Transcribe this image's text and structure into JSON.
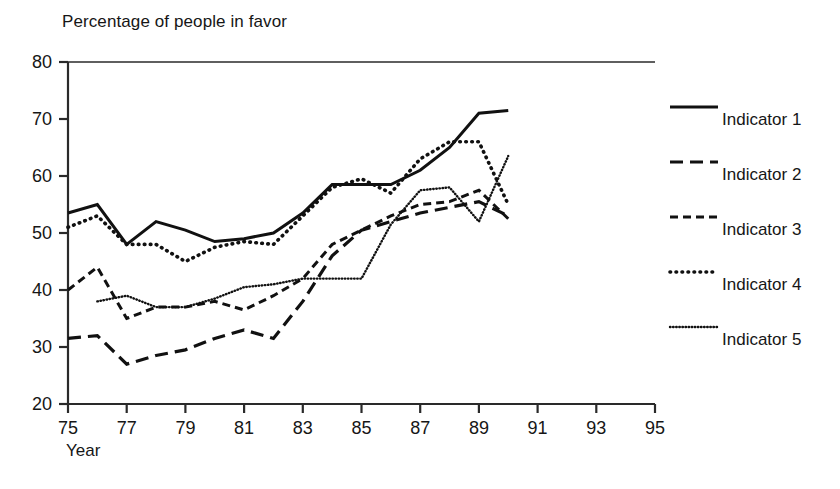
{
  "chart_data": {
    "type": "line",
    "title": "Percentage of people in favor",
    "xlabel": "Year",
    "ylabel": "",
    "xlim": [
      75,
      95
    ],
    "ylim": [
      20,
      80
    ],
    "xticks": [
      75,
      77,
      79,
      81,
      83,
      85,
      87,
      89,
      91,
      93,
      95
    ],
    "yticks": [
      20,
      30,
      40,
      50,
      60,
      70,
      80
    ],
    "xtick_labels": [
      "75",
      "77",
      "79",
      "81",
      "83",
      "85",
      "87",
      "89",
      "91",
      "93",
      "95"
    ],
    "ytick_labels": [
      "20",
      "30",
      "40",
      "50",
      "60",
      "70",
      "80"
    ],
    "grid": false,
    "legend_position": "right",
    "x": [
      75,
      76,
      77,
      78,
      79,
      80,
      81,
      82,
      83,
      84,
      85,
      86,
      87,
      88,
      89,
      90
    ],
    "series": [
      {
        "name": "Indicator 1",
        "style": "solid",
        "color": "#111111",
        "x": [
          75,
          76,
          77,
          78,
          79,
          80,
          81,
          82,
          83,
          84,
          85,
          86,
          87,
          88,
          89,
          90
        ],
        "values": [
          53.5,
          55.0,
          48.0,
          52.0,
          50.5,
          48.5,
          49.0,
          50.0,
          53.5,
          58.5,
          58.5,
          58.5,
          61.0,
          65.0,
          71.0,
          71.5
        ]
      },
      {
        "name": "Indicator 2",
        "style": "dash-long",
        "color": "#111111",
        "x": [
          75,
          76,
          77,
          78,
          79,
          80,
          81,
          82,
          83,
          84,
          85,
          86,
          87,
          88,
          89,
          90
        ],
        "values": [
          31.5,
          32.0,
          27.0,
          28.5,
          29.5,
          31.5,
          33.0,
          31.5,
          38.0,
          46.0,
          50.5,
          52.0,
          53.5,
          54.5,
          55.5,
          53.0
        ]
      },
      {
        "name": "Indicator 3",
        "style": "dash-medium",
        "color": "#111111",
        "x": [
          75,
          76,
          77,
          78,
          79,
          80,
          81,
          82,
          83,
          84,
          85,
          86,
          87,
          88,
          89,
          90
        ],
        "values": [
          40.0,
          44.0,
          35.0,
          37.0,
          37.0,
          38.0,
          36.5,
          39.0,
          42.0,
          48.0,
          50.5,
          53.0,
          55.0,
          55.5,
          57.5,
          52.5
        ]
      },
      {
        "name": "Indicator 4",
        "style": "dot-round",
        "color": "#111111",
        "x": [
          75,
          76,
          77,
          78,
          79,
          80,
          81,
          82,
          83,
          84,
          85,
          86,
          87,
          88,
          89,
          90
        ],
        "values": [
          51.0,
          53.0,
          48.0,
          48.0,
          45.0,
          47.5,
          48.5,
          48.0,
          53.0,
          58.0,
          59.5,
          57.0,
          63.0,
          66.0,
          66.0,
          55.0
        ]
      },
      {
        "name": "Indicator 5",
        "style": "dot-fine",
        "color": "#111111",
        "x": [
          76,
          77,
          78,
          79,
          80,
          81,
          82,
          83,
          84,
          85,
          86,
          87,
          88,
          89,
          90
        ],
        "values": [
          38.0,
          39.0,
          37.0,
          37.0,
          38.5,
          40.5,
          41.0,
          42.0,
          42.0,
          42.0,
          51.5,
          57.5,
          58.0,
          52.0,
          63.5
        ]
      }
    ]
  },
  "legend": {
    "items": [
      {
        "label": "Indicator 1",
        "style": "solid"
      },
      {
        "label": "Indicator 2",
        "style": "dash-long"
      },
      {
        "label": "Indicator 3",
        "style": "dash-medium"
      },
      {
        "label": "Indicator 4",
        "style": "dot-round"
      },
      {
        "label": "Indicator 5",
        "style": "dot-fine"
      }
    ]
  },
  "colors": {
    "ink": "#111111",
    "background": "#ffffff",
    "axis": "#2a2a2a"
  }
}
